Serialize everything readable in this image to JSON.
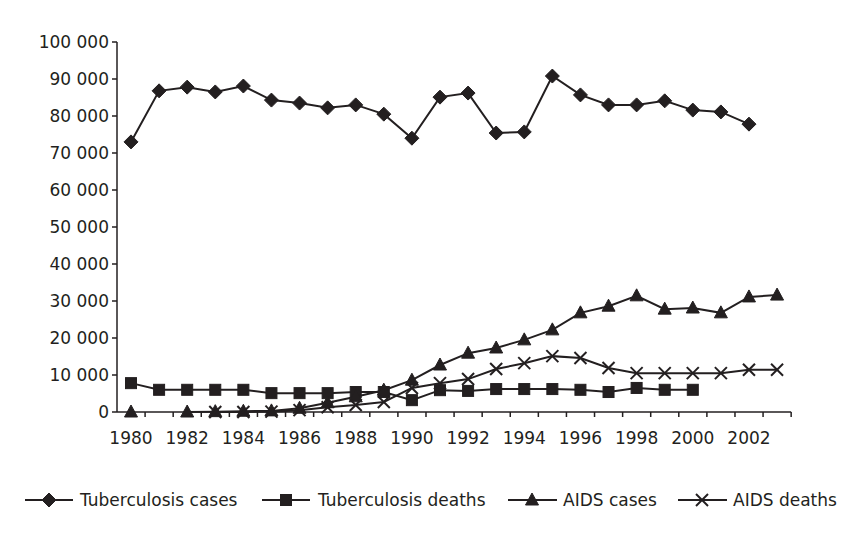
{
  "chart_data": {
    "type": "line",
    "title": "",
    "xlabel": "",
    "ylabel": "",
    "ylim": [
      0,
      100000
    ],
    "ytick_step": 10000,
    "ytick_labels": [
      "0",
      "10 000",
      "20 000",
      "30 000",
      "40 000",
      "50 000",
      "60 000",
      "70 000",
      "80 000",
      "90 000",
      "100 000"
    ],
    "x": [
      1980,
      1981,
      1982,
      1983,
      1984,
      1985,
      1986,
      1987,
      1988,
      1989,
      1990,
      1991,
      1992,
      1993,
      1994,
      1995,
      1996,
      1997,
      1998,
      1999,
      2000,
      2001,
      2002,
      2003
    ],
    "xtick_labels": [
      "1980",
      "1982",
      "1984",
      "1986",
      "1988",
      "1990",
      "1992",
      "1994",
      "1996",
      "1998",
      "2000",
      "2002"
    ],
    "grid": false,
    "legend_position": "bottom",
    "series": [
      {
        "name": "Tuberculosis cases",
        "marker": "diamond",
        "values": [
          73000,
          86800,
          87800,
          86500,
          88100,
          84300,
          83500,
          82200,
          83000,
          80500,
          74000,
          85100,
          86200,
          75400,
          75700,
          90800,
          85700,
          83000,
          83000,
          84100,
          81600,
          81100,
          77800,
          null
        ]
      },
      {
        "name": "Tuberculosis deaths",
        "marker": "square",
        "values": [
          7800,
          6000,
          6000,
          6000,
          6000,
          5100,
          5100,
          5100,
          5400,
          5400,
          3200,
          5900,
          5700,
          6200,
          6200,
          6200,
          6000,
          5400,
          6500,
          6000,
          6000,
          null,
          null,
          null
        ]
      },
      {
        "name": "AIDS cases",
        "marker": "triangle",
        "values": [
          0,
          null,
          0,
          100,
          200,
          300,
          1000,
          2500,
          4100,
          5900,
          8600,
          12700,
          15900,
          17300,
          19500,
          22200,
          26800,
          28600,
          31400,
          27800,
          28100,
          26800,
          31100,
          31600
        ]
      },
      {
        "name": "AIDS deaths",
        "marker": "x",
        "values": [
          null,
          null,
          null,
          0,
          0,
          100,
          500,
          1300,
          1900,
          2700,
          6500,
          7800,
          8900,
          11600,
          13200,
          15100,
          14600,
          11900,
          10500,
          10500,
          10500,
          10500,
          11400,
          11400
        ]
      }
    ]
  },
  "legend": {
    "items": [
      {
        "label": "Tuberculosis cases",
        "marker": "diamond"
      },
      {
        "label": "Tuberculosis deaths",
        "marker": "square"
      },
      {
        "label": "AIDS cases",
        "marker": "triangle"
      },
      {
        "label": "AIDS deaths",
        "marker": "x"
      }
    ]
  },
  "colors": {
    "ink": "#231f20",
    "background": "#ffffff"
  }
}
